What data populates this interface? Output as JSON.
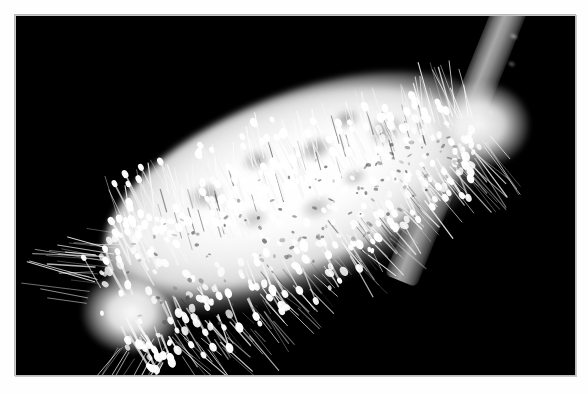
{
  "image": {
    "kind": "photograph",
    "subject": "pussy willow catkin",
    "scientific_subject": "Salix male catkin with exserted stamens",
    "palette": {
      "background": "#000000",
      "page": "#ffffff",
      "catkin_highlight": "#ffffff",
      "catkin_midtone": "#e2e2e2",
      "catkin_shadow": "#606060",
      "stem_light": "#a8a8a8",
      "stem_dark": "#2a2a2a",
      "border_rule": "#c9c9c9"
    },
    "frame": {
      "canvas_width": 588,
      "canvas_height": 394,
      "photo_x": 15,
      "photo_y": 15,
      "photo_width": 560,
      "photo_height": 360,
      "margin_color": "#ffffff"
    },
    "composition": {
      "orientation": "landscape",
      "subject_angle_degrees": -21,
      "subject_position": "diagonal from lower-left tip to upper-right stem attachment",
      "lighting": "high-key flash on black backdrop",
      "color_mode": "monochrome / desaturated"
    },
    "elements": [
      {
        "name": "catkin-body",
        "label": "catkin body"
      },
      {
        "name": "tip-fluff",
        "label": "silky tip"
      },
      {
        "name": "base-fluff",
        "label": "fuzzy base collar"
      },
      {
        "name": "stem",
        "label": "woody twig"
      },
      {
        "name": "anthers",
        "label": "anthers on filaments"
      }
    ]
  },
  "render": {
    "anther_count": 330,
    "hair_count": 260,
    "filament_count": 150
  }
}
